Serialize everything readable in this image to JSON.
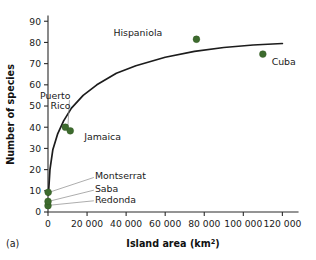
{
  "panel": {
    "label": "(a)"
  },
  "chart_data": {
    "type": "scatter",
    "title": "",
    "xlabel": "Island area (km2)",
    "xlabel_base": "Island area (km",
    "xlabel_sup": "2",
    "xlabel_tail": ")",
    "ylabel": "Number of species",
    "xlim": [
      0,
      128000
    ],
    "ylim": [
      0,
      92
    ],
    "grid": false,
    "legend": "none",
    "xticks": [
      0,
      20000,
      40000,
      60000,
      80000,
      100000,
      120000
    ],
    "xticklabels": [
      "0",
      "20 000",
      "40 000",
      "60 000",
      "80 000",
      "100 000",
      "120 000"
    ],
    "yticks": [
      0,
      10,
      20,
      30,
      40,
      50,
      60,
      70,
      80,
      90
    ],
    "yticklabels": [
      "0",
      "10",
      "20",
      "30",
      "40",
      "50",
      "60",
      "70",
      "80",
      "90"
    ],
    "points": [
      {
        "name": "Redonda",
        "x": 2.6,
        "y": 3.0,
        "label": "Redonda",
        "label_x": 24000,
        "label_y": 6.0,
        "leader": true
      },
      {
        "name": "Saba",
        "x": 13,
        "y": 5.0,
        "label": "Saba",
        "label_x": 24000,
        "label_y": 11.0,
        "leader": true
      },
      {
        "name": "Montserrat",
        "x": 102,
        "y": 9.3,
        "label": "Montserrat",
        "label_x": 24000,
        "label_y": 17.0,
        "leader": true
      },
      {
        "name": "Puerto Rico",
        "x": 8900,
        "y": 40.0,
        "label": "Puerto Rico",
        "label_x": 11500,
        "label_y": 53.5,
        "leader": true
      },
      {
        "name": "Jamaica",
        "x": 11400,
        "y": 38.3,
        "label": "Jamaica",
        "label_x": 18500,
        "label_y": 35.5,
        "leader": false
      },
      {
        "name": "Hispaniola",
        "x": 76000,
        "y": 81.5,
        "label": "Hispaniola",
        "label_x": 58500,
        "label_y": 84.5,
        "leader": false
      },
      {
        "name": "Cuba",
        "x": 110000,
        "y": 74.5,
        "label": "Cuba",
        "label_x": 114500,
        "label_y": 71.0,
        "leader": false
      }
    ],
    "fit_curve": {
      "description": "saturating species-area curve",
      "x": [
        200,
        1000,
        2500,
        5000,
        8000,
        12000,
        18000,
        25000,
        35000,
        45000,
        60000,
        75000,
        90000,
        105000,
        120000
      ],
      "y": [
        8,
        20,
        29.5,
        37,
        43,
        49,
        55,
        60,
        65.5,
        69,
        73,
        75.8,
        77.6,
        78.8,
        79.5
      ]
    },
    "colors": {
      "marker": "#3d6b2e",
      "curve": "#1c1c1c",
      "axis": "#2b2b2b",
      "leader": "#8a8a8a",
      "background": "#ffffff"
    }
  }
}
